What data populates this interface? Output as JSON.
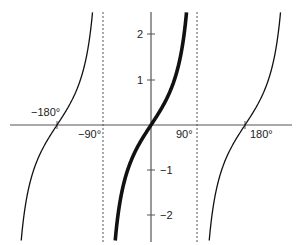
{
  "chart_data": {
    "type": "line",
    "title": "",
    "function": "y = tan(x)",
    "xlabel": "",
    "ylabel": "",
    "x_tick_labels": [
      "-180°",
      "-90°",
      "90°",
      "180°"
    ],
    "x_ticks_deg": [
      -180,
      -90,
      90,
      180
    ],
    "y_tick_labels": [
      "2",
      "1",
      "-1",
      "-2"
    ],
    "y_ticks": [
      2,
      1,
      -1,
      -2
    ],
    "xlim_deg": [
      -200,
      210
    ],
    "ylim": [
      -2.5,
      2.5
    ],
    "asymptotes_deg": [
      -90,
      90
    ],
    "grid": false,
    "legend": null,
    "series": [
      {
        "name": "tan branch (-270°, -90°)",
        "style": "thin",
        "x_deg": [
          -197,
          -190,
          -180,
          -170,
          -160,
          -150,
          -140,
          -135,
          -130,
          -123
        ],
        "y": [
          -2.5,
          -1.7,
          0,
          0.18,
          0.36,
          0.58,
          0.84,
          1.0,
          1.19,
          2.5
        ]
      },
      {
        "name": "principal branch (-90°, 90°)",
        "style": "bold",
        "x_deg": [
          -68,
          -60,
          -45,
          -30,
          -15,
          0,
          15,
          30,
          45,
          60,
          68
        ],
        "y": [
          -2.5,
          -1.73,
          -1.0,
          -0.58,
          -0.27,
          0,
          0.27,
          0.58,
          1.0,
          1.73,
          2.5
        ]
      },
      {
        "name": "tan branch (90°, 270°)",
        "style": "thin",
        "x_deg": [
          112,
          120,
          135,
          150,
          165,
          180,
          195,
          210,
          225,
          240,
          248
        ],
        "y": [
          -2.5,
          -1.73,
          -1.0,
          -0.58,
          -0.27,
          0,
          0.27,
          0.58,
          1.0,
          1.73,
          2.5
        ]
      }
    ]
  },
  "labels": {
    "x_neg180": "−180°",
    "x_neg90": "−90°",
    "x_pos90": "90°",
    "x_pos180": "180°",
    "y_2": "2",
    "y_1": "1",
    "y_neg1": "−1",
    "y_neg2": "−2"
  }
}
